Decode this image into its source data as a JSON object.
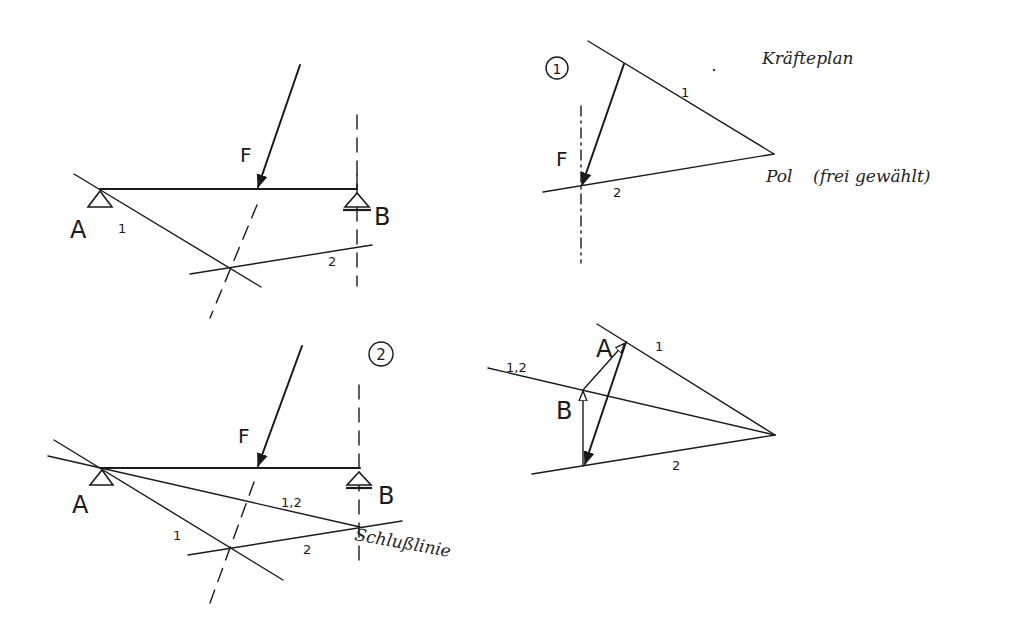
{
  "colors": {
    "ink": "#1a1a1a",
    "paper": "#ffffff"
  },
  "diagram_1": {
    "step_marker": "1",
    "lageplan": {
      "force_label": "F",
      "support_a_label": "A",
      "support_b_label": "B",
      "ray_1_label": "1",
      "ray_2_label": "2"
    },
    "kraefteplan": {
      "title": "Kräfteplan",
      "force_label": "F",
      "ray_1_label": "1",
      "ray_2_label": "2",
      "pole_label": "Pol",
      "pole_note": "(frei gewählt)"
    }
  },
  "diagram_2": {
    "step_marker": "2",
    "lageplan": {
      "force_label": "F",
      "support_a_label": "A",
      "support_b_label": "B",
      "ray_1_label": "1",
      "ray_2_label": "2",
      "closing_line_label": "1,2",
      "closing_line_name": "Schlußlinie"
    },
    "kraefteplan": {
      "reaction_a_label": "A",
      "reaction_b_label": "B",
      "ray_1_label": "1",
      "ray_2_label": "2",
      "closing_ray_label": "1,2"
    }
  }
}
